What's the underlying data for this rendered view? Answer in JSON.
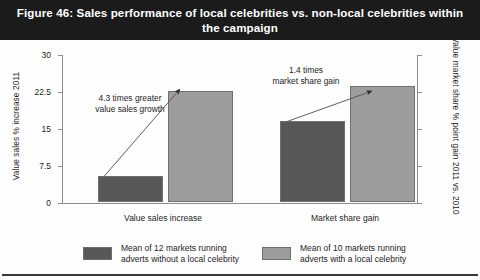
{
  "title": "Figure 46: Sales performance of local celebrities vs. non-local celebrities within the campaign",
  "colors": {
    "series_without_celebrity": "#575757",
    "series_with_celebrity": "#9d9d9d",
    "bar_edge": "#6f6f6f",
    "title_band": "#1b1b1b",
    "title_text": "#ffffff",
    "axis": "#8d8d8d",
    "text": "#1d1d1d"
  },
  "legend": {
    "position": "bottom",
    "entries": [
      {
        "label": "Mean of 12 markets running\nadverts without a local celebrity",
        "color": "#575757"
      },
      {
        "label": "Mean of 10 markets running\nadverts with a local celebrity",
        "color": "#9d9d9d"
      }
    ]
  },
  "chart_data": {
    "type": "bar",
    "title": "Figure 46: Sales performance of local celebrities vs. non-local celebrities within the campaign",
    "subtitle": "",
    "xlabel": "",
    "ylabel": "Value sales % increase 2011",
    "ylabel_secondary": "Value market share % point gain 2011 vs. 2010",
    "categories": [
      "Value sales increase",
      "Market share gain"
    ],
    "grid": false,
    "ylim": [
      0,
      30
    ],
    "yticks": [
      0,
      7.5,
      15,
      22.5,
      30
    ],
    "ytick_labels": [
      "0",
      "7.5",
      "15",
      "22.5",
      "30"
    ],
    "ylim_secondary": [
      0,
      0.3
    ],
    "yticks_secondary": [
      0,
      0.075,
      0.15,
      0.225,
      0.3
    ],
    "ytick_labels_secondary": [
      "0",
      "0.075",
      "0.15",
      "0.225",
      "0.3"
    ],
    "series": [
      {
        "name": "Mean of 12 markets running adverts without a local celebrity",
        "color": "#575757",
        "values": [
          5.2,
          0.165
        ],
        "axis": [
          "left",
          "right"
        ]
      },
      {
        "name": "Mean of 10 markets running adverts with a local celebrity",
        "color": "#9d9d9d",
        "values": [
          22.5,
          0.235
        ],
        "axis": [
          "left",
          "right"
        ]
      }
    ],
    "annotations": [
      {
        "text": "4.3 times greater\nvalue sales growth",
        "group": "Value sales increase",
        "ratio": 4.3
      },
      {
        "text": "1.4 times\nmarket share gain",
        "group": "Market share gain",
        "ratio": 1.4
      }
    ]
  }
}
